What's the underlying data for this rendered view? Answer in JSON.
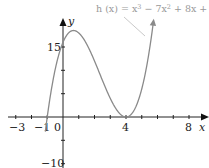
{
  "chart_data": {
    "type": "line",
    "title": "",
    "function_label": "h (x) = x³ − 7x² + 8x + 16",
    "function_parts": {
      "lhs": "h (x) = x",
      "p1": "3",
      "mid": " − 7x",
      "p2": "2",
      "rest": " + 8x + 16"
    },
    "xlabel": "x",
    "ylabel": "y",
    "x_ticks_labeled": [
      "−3",
      "−1",
      "0",
      "4",
      "8"
    ],
    "y_ticks_labeled": [
      "15",
      "−10"
    ],
    "xlim": [
      -3.5,
      8.8
    ],
    "ylim": [
      -10.5,
      20
    ],
    "grid": false,
    "series": [
      {
        "name": "h(x)",
        "color": "#8a8a8a",
        "x": [
          -1.1,
          -1,
          -0.5,
          0,
          0.5,
          0.67,
          1,
          1.5,
          2,
          2.5,
          3,
          3.5,
          4,
          4.5,
          5,
          5.5,
          6
        ],
        "values": [
          -8.1,
          0,
          10.1,
          16,
          18.4,
          18.5,
          18,
          16.1,
          12,
          6.9,
          4,
          1.1,
          0,
          1.1,
          6,
          15.1,
          28
        ]
      }
    ],
    "annotations": [
      "local max near (0.67, 18.5)",
      "double root at x = 4",
      "root near x = −1"
    ],
    "colors": {
      "axis": "#222222",
      "curve": "#8a8a8a",
      "label": "#999999"
    }
  }
}
